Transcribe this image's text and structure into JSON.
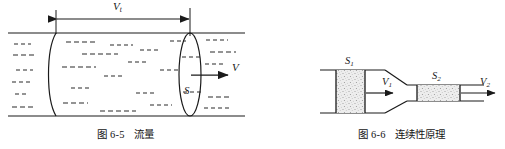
{
  "page": {
    "width": 505,
    "height": 149,
    "background": "#ffffff",
    "ink": "#1a1a1a",
    "fill_tone": "#e9e9e9"
  },
  "figures": [
    {
      "id": "figure-6-5",
      "caption_number": "图 6-5",
      "caption_title": "流量",
      "subject": "volumetric-flow-through-cross-section",
      "labels": {
        "length_dimension": "Vt",
        "length_dimension_base": "V",
        "length_dimension_sub": "t",
        "cross_section_area": "S",
        "velocity": "V"
      }
    },
    {
      "id": "figure-6-6",
      "caption_number": "图 6-6",
      "caption_title": "连续性原理",
      "subject": "continuity-principle-in-narrowing-pipe",
      "labels": {
        "area_wide_base": "S",
        "area_wide_sub": "1",
        "velocity_wide_base": "V",
        "velocity_wide_sub": "1",
        "area_narrow_base": "S",
        "area_narrow_sub": "2",
        "velocity_narrow_base": "V",
        "velocity_narrow_sub": "2"
      }
    }
  ]
}
